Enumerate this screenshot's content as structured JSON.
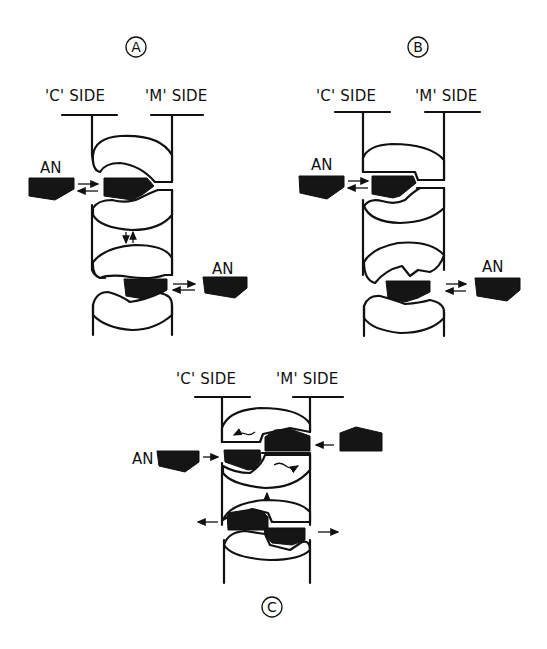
{
  "figure": {
    "panels": [
      {
        "id": "A",
        "circle_label": "A",
        "c_side_label": "'C' SIDE",
        "m_side_label": "'M' SIDE",
        "free_an_labels": [
          "AN",
          "AN"
        ],
        "description": "Carrier with two AN binding sites, one open to C side and one open to M side, exchange arrows between free and bound AN"
      },
      {
        "id": "B",
        "circle_label": "B",
        "c_side_label": "'C' SIDE",
        "m_side_label": "'M' SIDE",
        "free_an_labels": [
          "AN",
          "AN"
        ],
        "description": "Conformational variant with AN bound at both sites, exchange arrows"
      },
      {
        "id": "C",
        "circle_label": "C",
        "c_side_label": "'C' SIDE",
        "m_side_label": "'M' SIDE",
        "free_an_labels": [
          "AN"
        ],
        "description": "Transport scheme: AN enters from C side and M side, subunit rotation arrows, AN released outward"
      }
    ],
    "colors": {
      "ink": "#111111",
      "background": "#ffffff",
      "ligand_fill": "#151515"
    }
  }
}
